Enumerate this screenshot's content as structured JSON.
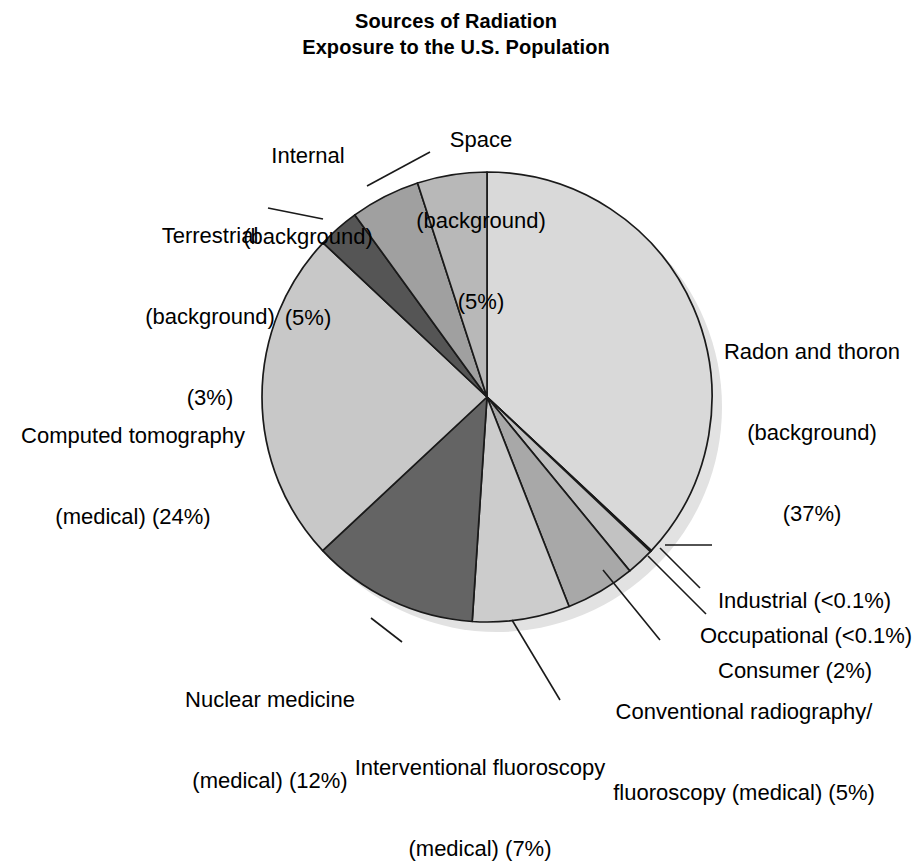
{
  "title": {
    "line1": "Sources of Radiation",
    "line2": "Exposure to the U.S. Population"
  },
  "labels": {
    "space": {
      "l1": "Space",
      "l2": "(background)",
      "l3": "(5%)"
    },
    "internal": {
      "l1": "Internal",
      "l2": "(background)",
      "l3": "(5%)"
    },
    "terrestrial": {
      "l1": "Terrestrial",
      "l2": "(background)",
      "l3": "(3%)"
    },
    "radon": {
      "l1": "Radon and thoron",
      "l2": "(background)",
      "l3": "(37%)"
    },
    "computed_tomography": {
      "l1": "Computed tomography",
      "l2": "(medical) (24%)"
    },
    "industrial": {
      "l1": "Industrial (<0.1%)"
    },
    "occupational": {
      "l1": "Occupational (<0.1%)"
    },
    "consumer": {
      "l1": "Consumer (2%)"
    },
    "conventional_radiography": {
      "l1": "Conventional radiography/",
      "l2": "fluoroscopy (medical) (5%)"
    },
    "nuclear_medicine": {
      "l1": "Nuclear medicine",
      "l2": "(medical) (12%)"
    },
    "interventional_fluoroscopy": {
      "l1": "Interventional fluoroscopy",
      "l2": "(medical) (7%)"
    }
  },
  "chart_data": {
    "type": "pie",
    "title": "Sources of Radiation Exposure to the U.S. Population",
    "units": "percent of total effective dose",
    "start_angle_deg": 0,
    "direction": "clockwise",
    "center_px": [
      487,
      397
    ],
    "radius_px": 225,
    "legend": "none (direct callout labels with leader lines)",
    "grid": false,
    "labels": [
      "Radon and thoron (background)",
      "Industrial",
      "Occupational",
      "Consumer",
      "Conventional radiography/fluoroscopy (medical)",
      "Interventional fluoroscopy (medical)",
      "Nuclear medicine (medical)",
      "Computed tomography (medical)",
      "Terrestrial (background)",
      "Internal (background)",
      "Space (background)"
    ],
    "values": [
      37,
      0.05,
      0.05,
      2,
      5,
      7,
      12,
      24,
      3,
      5,
      5
    ],
    "value_labels": [
      "37%",
      "<0.1%",
      "<0.1%",
      "2%",
      "5%",
      "7%",
      "12%",
      "24%",
      "3%",
      "5%",
      "5%"
    ],
    "colors": [
      "#d9d9d9",
      "#4d4d4d",
      "#9e9e9e",
      "#c2c2c2",
      "#a8a8a8",
      "#cccccc",
      "#646464",
      "#c8c8c8",
      "#555555",
      "#a0a0a0",
      "#b8b8b8"
    ],
    "slices": [
      {
        "name": "Radon and thoron (background)",
        "value": 37,
        "value_label": "37%",
        "color": "#d9d9d9",
        "category": "background"
      },
      {
        "name": "Industrial",
        "value": 0.05,
        "value_label": "<0.1%",
        "color": "#4d4d4d",
        "category": "other"
      },
      {
        "name": "Occupational",
        "value": 0.05,
        "value_label": "<0.1%",
        "color": "#9e9e9e",
        "category": "other"
      },
      {
        "name": "Consumer",
        "value": 2,
        "value_label": "2%",
        "color": "#c2c2c2",
        "category": "other"
      },
      {
        "name": "Conventional radiography/fluoroscopy (medical)",
        "value": 5,
        "value_label": "5%",
        "color": "#a8a8a8",
        "category": "medical"
      },
      {
        "name": "Interventional fluoroscopy (medical)",
        "value": 7,
        "value_label": "7%",
        "color": "#cccccc",
        "category": "medical"
      },
      {
        "name": "Nuclear medicine (medical)",
        "value": 12,
        "value_label": "12%",
        "color": "#646464",
        "category": "medical"
      },
      {
        "name": "Computed tomography (medical)",
        "value": 24,
        "value_label": "24%",
        "color": "#c8c8c8",
        "category": "medical"
      },
      {
        "name": "Terrestrial (background)",
        "value": 3,
        "value_label": "3%",
        "color": "#555555",
        "category": "background"
      },
      {
        "name": "Internal (background)",
        "value": 5,
        "value_label": "5%",
        "color": "#a0a0a0",
        "category": "background"
      },
      {
        "name": "Space (background)",
        "value": 5,
        "value_label": "5%",
        "color": "#b8b8b8",
        "category": "background"
      }
    ]
  },
  "style": {
    "background": "#ffffff",
    "outline": "#1a1a1a",
    "shadow": "#e0e0e0",
    "text": "#000000"
  }
}
